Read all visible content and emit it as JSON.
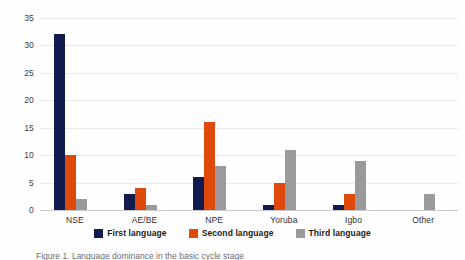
{
  "chart_data": {
    "type": "bar",
    "title": "",
    "xlabel": "",
    "ylabel": "",
    "categories": [
      "NSE",
      "AE/BE",
      "NPE",
      "Yoruba",
      "Igbo",
      "Other"
    ],
    "series": [
      {
        "name": "First language",
        "color": "#111b4e",
        "values": [
          32,
          3,
          6,
          1,
          1,
          0
        ]
      },
      {
        "name": "Second language",
        "color": "#e0490c",
        "values": [
          10,
          4,
          16,
          5,
          3,
          0
        ]
      },
      {
        "name": "Third language",
        "color": "#9a9a9c",
        "values": [
          2,
          1,
          8,
          11,
          9,
          3
        ]
      }
    ],
    "ylim": [
      0,
      35
    ],
    "yticks": [
      0,
      5,
      10,
      15,
      20,
      25,
      30,
      35
    ],
    "ytick_labels": [
      "0",
      "5",
      "10",
      "15",
      "20",
      "25",
      "30",
      "35"
    ],
    "grid": true,
    "legend_position": "bottom"
  },
  "caption": {
    "text": "Figure 1. Language dominance in the basic cycle stage"
  }
}
